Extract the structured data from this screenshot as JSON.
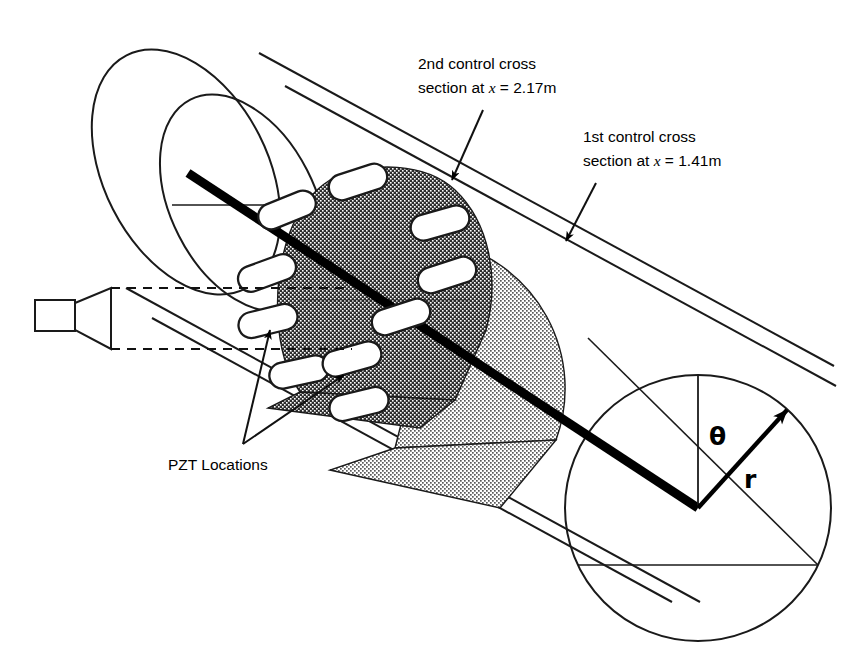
{
  "figure": {
    "type": "technical-diagram"
  },
  "annotations": {
    "second_section": {
      "line1": "2nd control cross",
      "line2_pre": "section at ",
      "line2_var": "x",
      "line2_post": " = 2.17m",
      "x_value": "2.17",
      "unit": "m"
    },
    "first_section": {
      "line1": "1st control cross",
      "line2_pre": "section at ",
      "line2_var": "x",
      "line2_post": " = 1.41m",
      "x_value": "1.41",
      "unit": "m"
    },
    "pzt": {
      "label": "PZT Locations",
      "count": 10
    }
  },
  "coordinates": {
    "theta_symbol": "θ",
    "radius_symbol": "r"
  },
  "colors": {
    "stroke": "#1a1a1a",
    "dark_patch": "#3a3a3a",
    "light_patch": "#c9c9c9",
    "pill_fill": "#ffffff",
    "background": "#ffffff"
  },
  "elements": {
    "duct": "cylindrical-duct",
    "source": "acoustic-horn-speaker",
    "axis": "duct-centerline"
  }
}
